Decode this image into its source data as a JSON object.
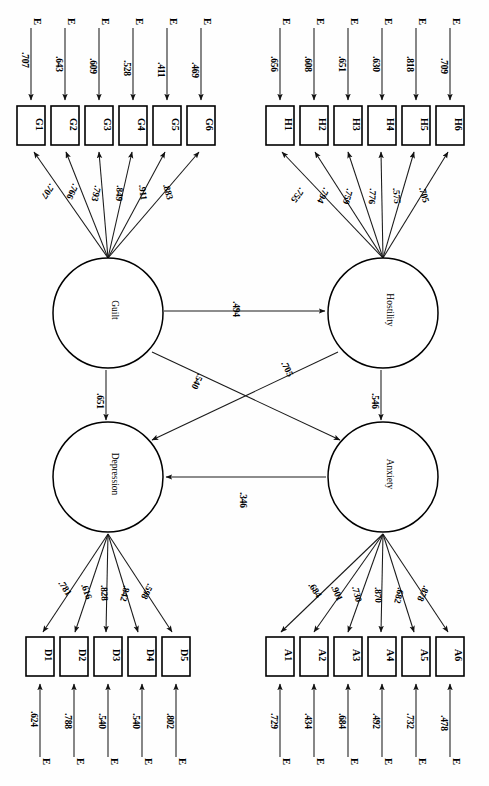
{
  "figure": {
    "type": "sem-path-diagram",
    "orientation": "rotated-90-ccw",
    "latents": [
      {
        "id": "guilt",
        "label": "Guilt"
      },
      {
        "id": "hostility",
        "label": "Hostility"
      },
      {
        "id": "depression",
        "label": "Depression"
      },
      {
        "id": "anxiety",
        "label": "Anxiety"
      }
    ],
    "error_symbol": "E",
    "indicator_groups": [
      {
        "latent": "Guilt",
        "prefix": "G",
        "indicators": [
          "G1",
          "G2",
          "G3",
          "G4",
          "G5",
          "G6"
        ],
        "loadings": [
          ".707",
          ".766",
          ".793",
          ".849",
          ".911",
          ".883"
        ],
        "errors": [
          ".707",
          ".643",
          ".609",
          ".528",
          ".411",
          ".469"
        ]
      },
      {
        "latent": "Hostility",
        "prefix": "H",
        "indicators": [
          "H1",
          "H2",
          "H3",
          "H4",
          "H5",
          "H6"
        ],
        "loadings": [
          ".755",
          ".794",
          ".759",
          ".776",
          ".575",
          ".705"
        ],
        "errors": [
          ".656",
          ".608",
          ".651",
          ".630",
          ".818",
          ".709"
        ]
      },
      {
        "latent": "Depression",
        "prefix": "D",
        "indicators": [
          "D1",
          "D2",
          "D3",
          "D4",
          "D5"
        ],
        "loadings": [
          ".781",
          ".616",
          ".828",
          ".842",
          ".598"
        ],
        "errors": [
          ".624",
          ".788",
          ".540",
          ".540",
          ".802"
        ]
      },
      {
        "latent": "Anxiety",
        "prefix": "A",
        "indicators": [
          "A1",
          "A2",
          "A3",
          "A4",
          "A5",
          "A6"
        ],
        "loadings": [
          ".684",
          ".901",
          ".730",
          ".870",
          ".682",
          ".878"
        ],
        "errors": [
          ".729",
          ".434",
          ".684",
          ".492",
          ".732",
          ".478"
        ]
      }
    ],
    "structural_paths": [
      {
        "id": "guilt-hostility",
        "from": "Guilt",
        "to": "Hostility",
        "coef": ".494"
      },
      {
        "id": "guilt-depression",
        "from": "Guilt",
        "to": "Depression",
        "coef": ".651"
      },
      {
        "id": "guilt-anxiety",
        "from": "Guilt",
        "to": "Anxiety",
        "coef": ".540"
      },
      {
        "id": "hostility-depression",
        "from": "Hostility",
        "to": "Depression",
        "coef": ".705"
      },
      {
        "id": "hostility-anxiety",
        "from": "Hostility",
        "to": "Anxiety",
        "coef": ".546"
      },
      {
        "id": "anxiety-depression",
        "from": "Anxiety",
        "to": "Depression",
        "coef": ".346"
      }
    ]
  }
}
